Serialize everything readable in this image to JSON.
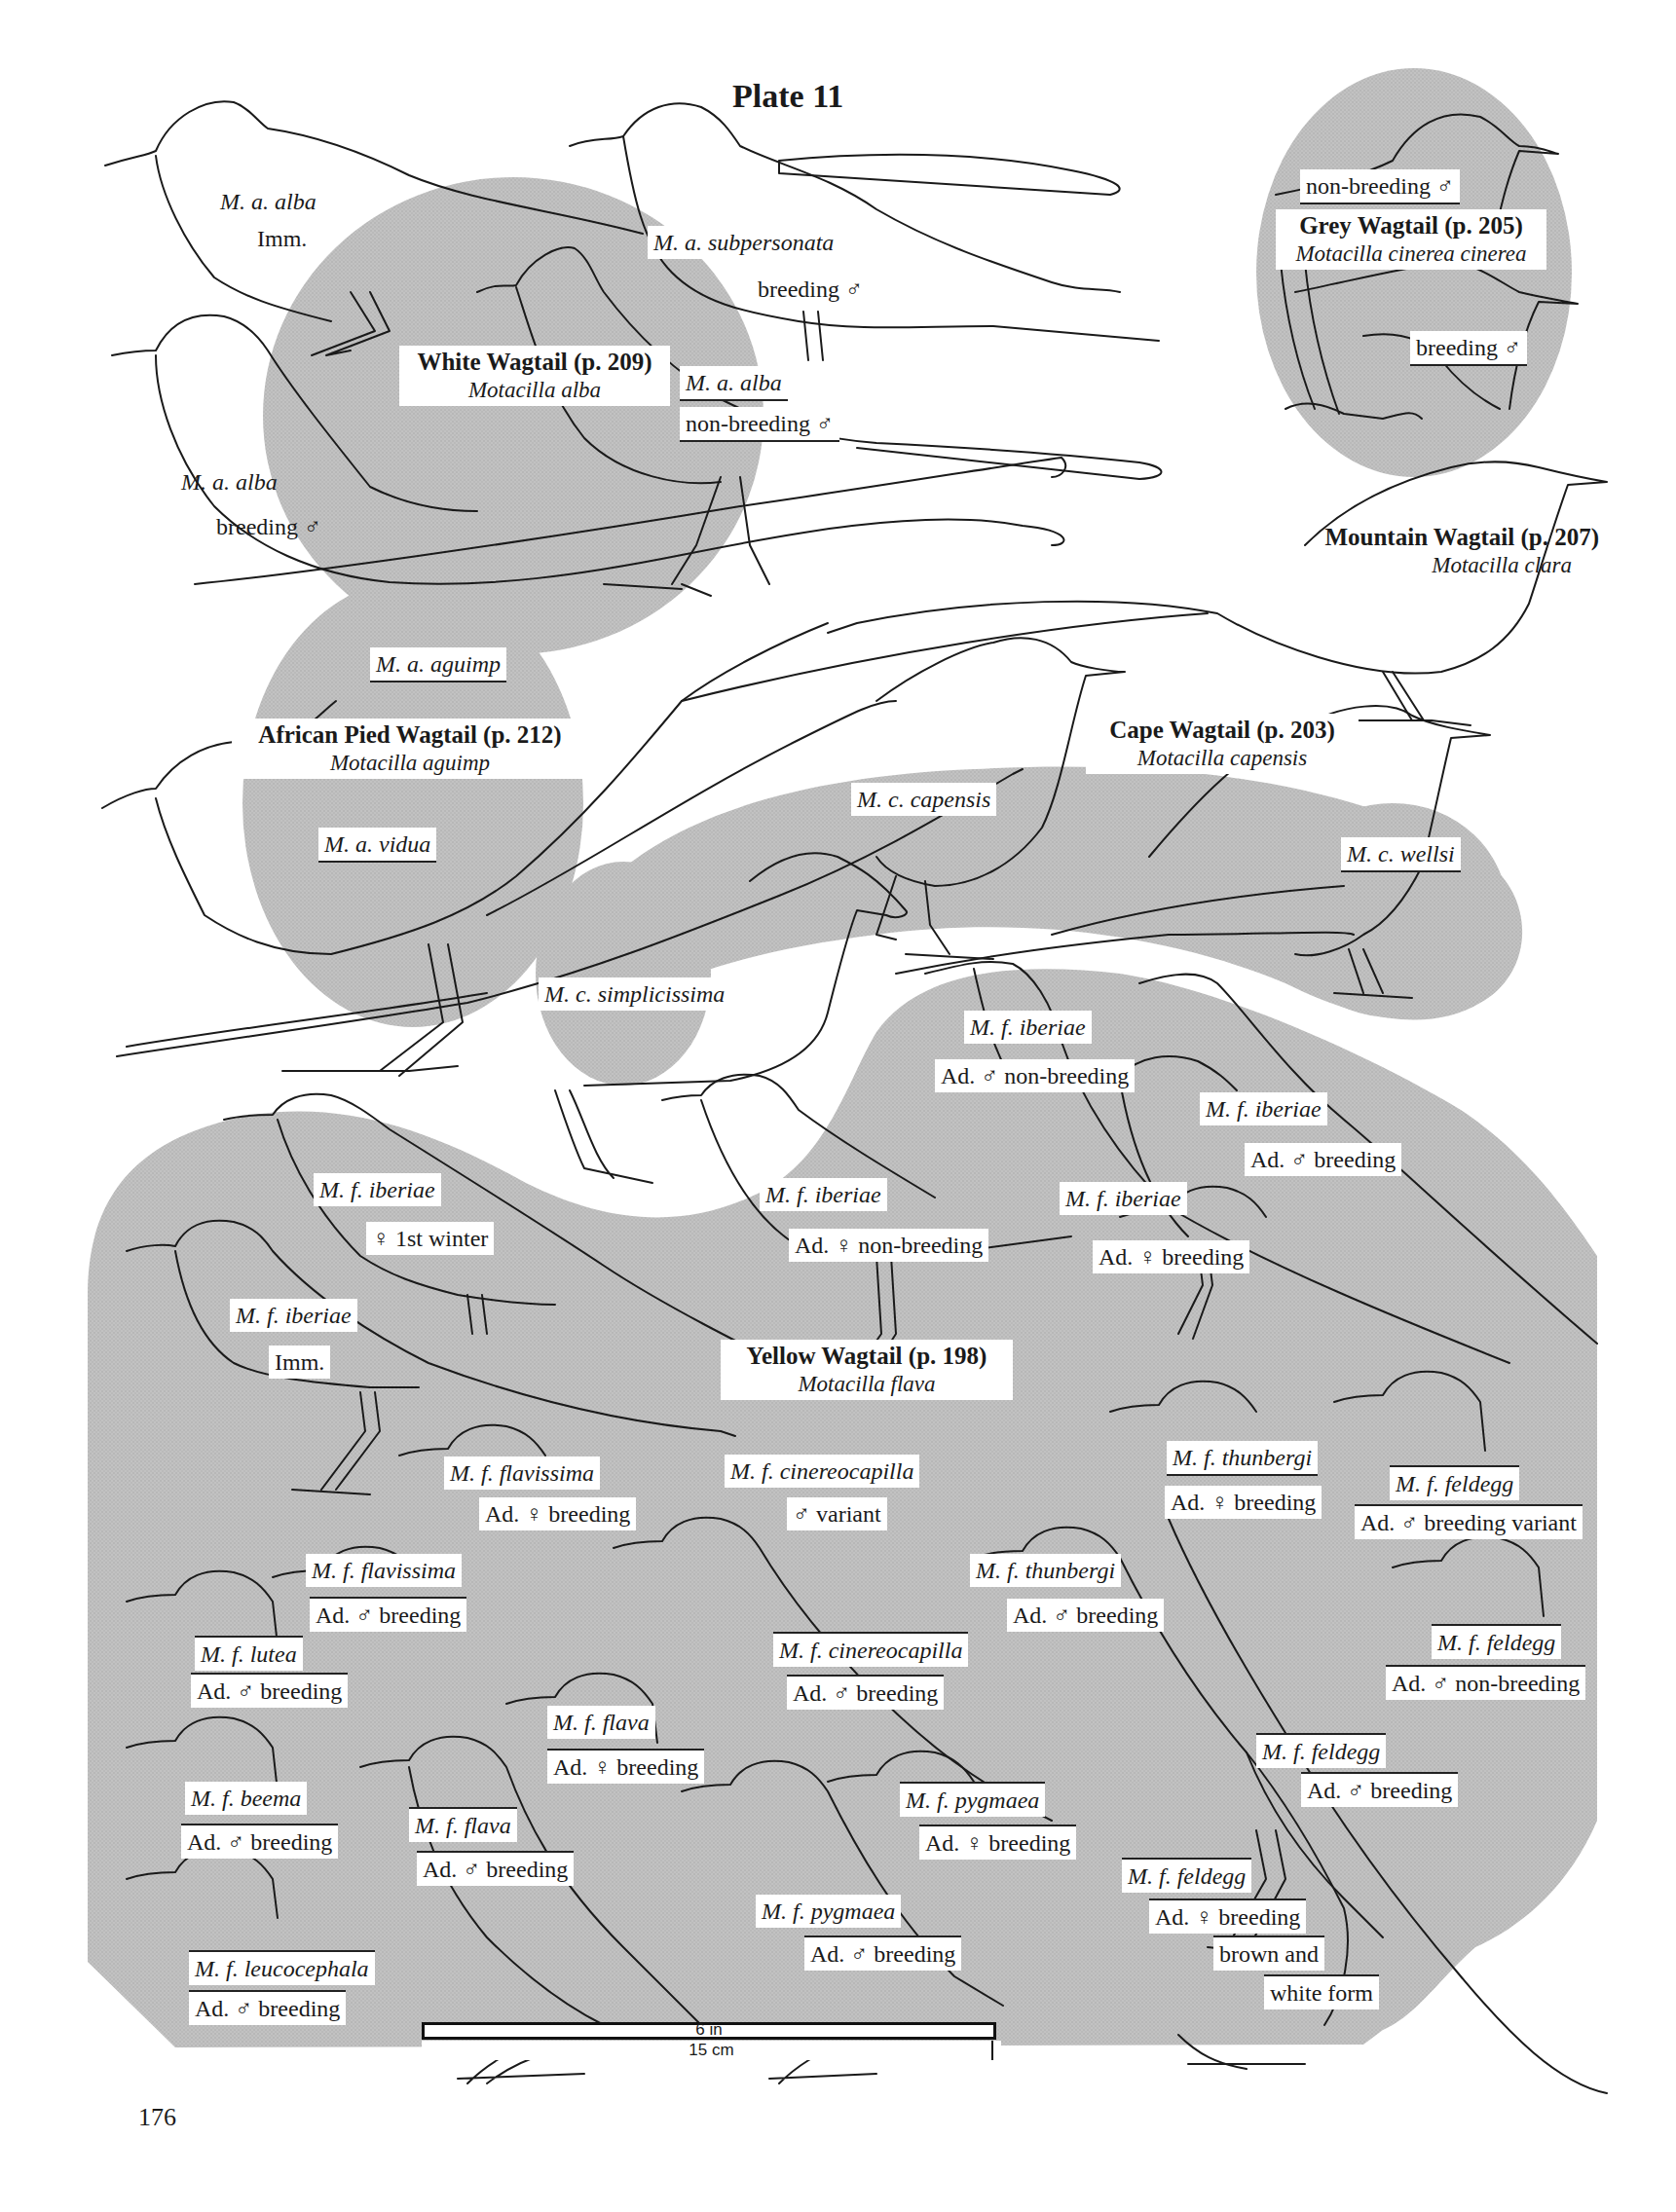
{
  "plate": {
    "title": "Plate 11",
    "page_number": "176",
    "shade_color": "#bdbdbd",
    "line_color": "#1a1a1a"
  },
  "species": [
    {
      "name": "White Wagtail (p. 209)",
      "scientific": "Motacilla alba"
    },
    {
      "name": "Grey Wagtail (p. 205)",
      "scientific": "Motacilla cinerea cinerea"
    },
    {
      "name": "Mountain Wagtail (p. 207)",
      "scientific": "Motacilla clara"
    },
    {
      "name": "African Pied Wagtail (p. 212)",
      "scientific": "Motacilla aguimp"
    },
    {
      "name": "Cape Wagtail (p. 203)",
      "scientific": "Motacilla capensis"
    },
    {
      "name": "Yellow Wagtail (p. 198)",
      "scientific": "Motacilla flava"
    }
  ],
  "labels": {
    "white": [
      {
        "taxon": "M. a. alba",
        "note": "Imm."
      },
      {
        "taxon": "M. a. subpersonata",
        "note": "breeding ♂"
      },
      {
        "taxon": "M. a. alba",
        "note": "non-breeding ♂"
      },
      {
        "taxon": "M. a. alba",
        "note": "breeding ♂"
      }
    ],
    "grey": [
      {
        "note": "non-breeding ♂"
      },
      {
        "note": "breeding ♂"
      }
    ],
    "pied": [
      {
        "taxon": "M. a. aguimp"
      },
      {
        "taxon": "M. a. vidua"
      }
    ],
    "cape": [
      {
        "taxon": "M. c. capensis"
      },
      {
        "taxon": "M. c. wellsi"
      },
      {
        "taxon": "M. c. simplicissima"
      }
    ],
    "yellow": [
      {
        "taxon": "M. f. iberiae",
        "note": "Ad. ♂ non-breeding"
      },
      {
        "taxon": "M. f. iberiae",
        "note": "Ad. ♂ breeding"
      },
      {
        "taxon": "M. f. iberiae",
        "note": "♀ 1st winter"
      },
      {
        "taxon": "M. f. iberiae",
        "note": "Ad. ♀ non-breeding"
      },
      {
        "taxon": "M. f. iberiae",
        "note": "Ad. ♀ breeding"
      },
      {
        "taxon": "M. f. iberiae",
        "note": "Imm."
      },
      {
        "taxon": "M. f. flavissima",
        "note": "Ad. ♀ breeding"
      },
      {
        "taxon": "M. f. cinereocapilla",
        "note": "♂ variant"
      },
      {
        "taxon": "M. f. thunbergi",
        "note": "Ad. ♀ breeding"
      },
      {
        "taxon": "M. f. feldegg",
        "note": "Ad. ♂ breeding variant"
      },
      {
        "taxon": "M. f. flavissima",
        "note": "Ad. ♂ breeding"
      },
      {
        "taxon": "M. f. thunbergi",
        "note": "Ad. ♂ breeding"
      },
      {
        "taxon": "M. f. lutea",
        "note": "Ad. ♂ breeding"
      },
      {
        "taxon": "M. f. cinereocapilla",
        "note": "Ad. ♂ breeding"
      },
      {
        "taxon": "M. f. feldegg",
        "note": "Ad. ♂ non-breeding"
      },
      {
        "taxon": "M. f. flava",
        "note": "Ad. ♀ breeding"
      },
      {
        "taxon": "M. f. beema",
        "note": "Ad. ♂ breeding"
      },
      {
        "taxon": "M. f. pygmaea",
        "note": "Ad. ♀ breeding"
      },
      {
        "taxon": "M. f. feldegg",
        "note": "Ad. ♂ breeding"
      },
      {
        "taxon": "M. f. flava",
        "note": "Ad. ♂ breeding"
      },
      {
        "taxon": "M. f. feldegg",
        "note": "Ad. ♀ breeding",
        "note2": "brown and",
        "note3": "white form"
      },
      {
        "taxon": "M. f. pygmaea",
        "note": "Ad. ♂ breeding"
      },
      {
        "taxon": "M. f. leucocephala",
        "note": "Ad. ♂ breeding"
      }
    ]
  },
  "scale_bar": {
    "imperial": "6 in",
    "metric": "15 cm"
  }
}
